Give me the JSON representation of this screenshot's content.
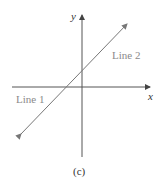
{
  "figure": {
    "axes": {
      "x_label": "x",
      "y_label": "y",
      "color": "#555555"
    },
    "line": {
      "color": "#777777",
      "labels": [
        "Line 1",
        "Line 2"
      ],
      "description": "Two coincident lines with positive slope, shown as a single line"
    },
    "caption": "(c)",
    "label_color": "#8a8a8a"
  }
}
